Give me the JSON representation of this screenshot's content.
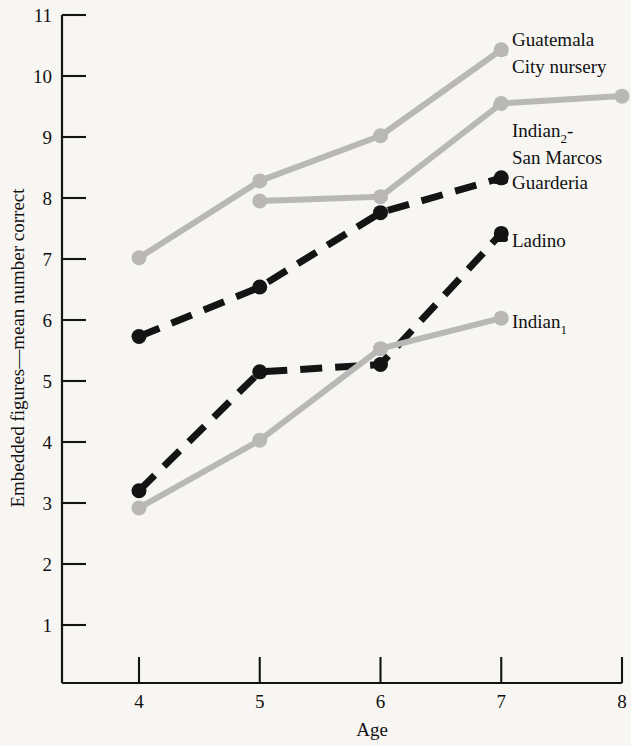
{
  "chart_data": {
    "type": "line",
    "title": "",
    "xlabel": "Age",
    "ylabel": "Embedded figures—mean number correct",
    "x": [
      4,
      5,
      6,
      7,
      8
    ],
    "xticks": [
      "4",
      "5",
      "6",
      "7",
      "8"
    ],
    "yticks": [
      "1",
      "2",
      "3",
      "4",
      "5",
      "6",
      "7",
      "8",
      "9",
      "10",
      "11"
    ],
    "xlim": [
      3.6,
      8.0
    ],
    "ylim": [
      0.05,
      11.0
    ],
    "grid": false,
    "legend_position": "right-inline-labels",
    "series": [
      {
        "name": "Guatemala City nursery",
        "label_lines": [
          "Guatemala",
          "City nursery"
        ],
        "style": "solid",
        "color": "#b9b8b6",
        "marker": "circle",
        "x": [
          4,
          5,
          6,
          7
        ],
        "values": [
          7.02,
          8.28,
          9.02,
          10.43
        ]
      },
      {
        "name": "Indian2-San Marcos",
        "label_lines": [
          "Indian₂-",
          "San Marcos"
        ],
        "style": "solid",
        "color": "#b9b8b6",
        "marker": "circle",
        "x": [
          5,
          6,
          7,
          8
        ],
        "values": [
          7.95,
          8.02,
          9.55,
          9.67
        ]
      },
      {
        "name": "Guarderia",
        "label_lines": [
          "Guarderia"
        ],
        "style": "dashed",
        "color": "#141414",
        "marker": "circle",
        "x": [
          4,
          5,
          6,
          7
        ],
        "values": [
          5.73,
          6.54,
          7.76,
          8.33
        ]
      },
      {
        "name": "Ladino",
        "label_lines": [
          "Ladino"
        ],
        "style": "dashed",
        "color": "#141414",
        "marker": "circle",
        "x": [
          4,
          5,
          6,
          7
        ],
        "values": [
          3.2,
          5.15,
          5.27,
          7.42
        ]
      },
      {
        "name": "Indian1",
        "label_lines": [
          "Indian₁"
        ],
        "style": "solid",
        "color": "#b9b8b6",
        "marker": "circle",
        "x": [
          4,
          5,
          6,
          7
        ],
        "values": [
          2.92,
          4.03,
          5.53,
          6.03
        ]
      }
    ]
  },
  "axes": {
    "y_axis_title": "Embedded figures—mean number correct",
    "x_axis_title": "Age",
    "y_tick_labels": [
      "11",
      "10",
      "9",
      "8",
      "7",
      "6",
      "5",
      "4",
      "3",
      "2",
      "1"
    ],
    "x_tick_labels": [
      "4",
      "5",
      "6",
      "7",
      "8"
    ]
  },
  "labels": {
    "guatemala_line1": "Guatemala",
    "guatemala_line2": "City nursery",
    "indian2_line1_a": "Indian",
    "indian2_line1_sub": "2",
    "indian2_line1_b": "-",
    "indian2_line2": "San Marcos",
    "guarderia": "Guarderia",
    "ladino": "Ladino",
    "indian1_a": "Indian",
    "indian1_sub": "1"
  },
  "colors": {
    "background": "#f7f6f3",
    "ink": "#141414",
    "gray_series": "#b9b8b6"
  }
}
